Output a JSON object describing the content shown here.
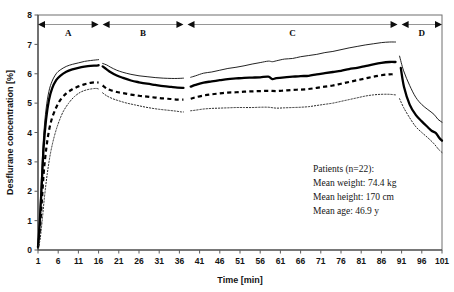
{
  "chart_data": {
    "type": "line",
    "title": "",
    "xlabel": "Time [min]",
    "ylabel": "Desflurane concentration [%]",
    "xlim": [
      1,
      101
    ],
    "ylim": [
      0,
      8
    ],
    "xticks": [
      1,
      6,
      11,
      16,
      21,
      26,
      31,
      36,
      41,
      46,
      51,
      56,
      61,
      66,
      71,
      76,
      81,
      86,
      91,
      96,
      101
    ],
    "yticks": [
      0,
      1,
      2,
      3,
      4,
      5,
      6,
      7,
      8
    ],
    "grid": false,
    "legend_position": "none",
    "x_tick_labels": [
      "1",
      "6",
      "11",
      "16",
      "21",
      "26",
      "31",
      "36",
      "41",
      "46",
      "51",
      "56",
      "61",
      "66",
      "71",
      "76",
      "81",
      "86",
      "91",
      "96",
      "101"
    ],
    "y_tick_labels": [
      "0",
      "1",
      "2",
      "3",
      "4",
      "5",
      "6",
      "7",
      "8"
    ],
    "phases": [
      {
        "label": "A",
        "x_start": 1,
        "x_end": 16
      },
      {
        "label": "B",
        "x_start": 17,
        "x_end": 37
      },
      {
        "label": "C",
        "x_start": 38,
        "x_end": 90
      },
      {
        "label": "D",
        "x_start": 91,
        "x_end": 101
      }
    ],
    "annotations": [
      "Patients (n=22):",
      "Mean weight:  74.4 kg",
      "Mean height:  170 cm",
      "Mean age: 46.9 y"
    ],
    "series": [
      {
        "name": "upper-percentile",
        "style": "thin-solid",
        "segments": [
          {
            "x": [
              1,
              1.4,
              1.9,
              2.4,
              3,
              3.7,
              4.5,
              5.5,
              6.5,
              8,
              9.5,
              11,
              12.5,
              14,
              15.3,
              16
            ],
            "y": [
              0.15,
              1.1,
              2.6,
              3.9,
              4.8,
              5.4,
              5.75,
              6.0,
              6.13,
              6.25,
              6.32,
              6.37,
              6.42,
              6.45,
              6.47,
              6.48
            ]
          },
          {
            "x": [
              17,
              18,
              19,
              20.5,
              22,
              24,
              26,
              28,
              30,
              32,
              34,
              35.5,
              37
            ],
            "y": [
              6.35,
              6.3,
              6.22,
              6.12,
              6.05,
              5.98,
              5.93,
              5.9,
              5.87,
              5.85,
              5.84,
              5.84,
              5.85
            ]
          },
          {
            "x": [
              38.8,
              40,
              42,
              44,
              46,
              48,
              50,
              52,
              54,
              56,
              58,
              59,
              60,
              62,
              64,
              66,
              68,
              70,
              72,
              74,
              76,
              78,
              80,
              82,
              84,
              86,
              88,
              89.5
            ],
            "y": [
              5.88,
              5.93,
              6.02,
              6.06,
              6.12,
              6.18,
              6.22,
              6.27,
              6.33,
              6.38,
              6.43,
              6.41,
              6.44,
              6.5,
              6.52,
              6.58,
              6.62,
              6.66,
              6.72,
              6.76,
              6.82,
              6.88,
              6.93,
              6.98,
              7.02,
              7.06,
              7.08,
              7.08
            ]
          },
          {
            "x": [
              90.5,
              91.5,
              93,
              94.5,
              96,
              97.5,
              99,
              100,
              101
            ],
            "y": [
              6.6,
              6.1,
              5.6,
              5.2,
              4.95,
              4.78,
              4.62,
              4.45,
              4.35
            ]
          }
        ]
      },
      {
        "name": "mean",
        "style": "thick-solid",
        "segments": [
          {
            "x": [
              1,
              1.4,
              1.9,
              2.4,
              3,
              3.7,
              4.5,
              5.5,
              6.5,
              8,
              9.5,
              11,
              12.5,
              14,
              15.3,
              16
            ],
            "y": [
              0.1,
              0.85,
              2.15,
              3.5,
              4.45,
              5.1,
              5.5,
              5.78,
              5.93,
              6.07,
              6.15,
              6.2,
              6.24,
              6.27,
              6.28,
              6.29
            ]
          },
          {
            "x": [
              17,
              18,
              19,
              20.5,
              22,
              24,
              26,
              28,
              30,
              32,
              34,
              35.5,
              37
            ],
            "y": [
              6.25,
              6.15,
              6.05,
              5.94,
              5.86,
              5.77,
              5.71,
              5.66,
              5.62,
              5.58,
              5.55,
              5.53,
              5.52
            ]
          },
          {
            "x": [
              38.8,
              40,
              42,
              44,
              46,
              48,
              50,
              52,
              54,
              56,
              58,
              59,
              60,
              62,
              64,
              66,
              68,
              70,
              72,
              74,
              76,
              78,
              80,
              82,
              84,
              86,
              88,
              89.5
            ],
            "y": [
              5.56,
              5.62,
              5.7,
              5.74,
              5.78,
              5.82,
              5.84,
              5.86,
              5.87,
              5.88,
              5.9,
              5.82,
              5.85,
              5.88,
              5.9,
              5.92,
              5.93,
              5.98,
              6.02,
              6.06,
              6.1,
              6.16,
              6.2,
              6.26,
              6.32,
              6.37,
              6.4,
              6.4
            ]
          },
          {
            "x": [
              90.8,
              91.6,
              93,
              94.5,
              96,
              97.5,
              98.5,
              99.5,
              100.3,
              101
            ],
            "y": [
              6.2,
              5.55,
              4.95,
              4.6,
              4.38,
              4.18,
              4.05,
              3.98,
              3.82,
              3.72
            ]
          }
        ]
      },
      {
        "name": "lower-percentile-dashed",
        "style": "thick-dashed",
        "segments": [
          {
            "x": [
              1,
              1.4,
              1.9,
              2.4,
              3,
              3.7,
              4.5,
              5.5,
              6.5,
              8,
              9.5,
              11,
              12.5,
              14,
              15.3,
              16
            ],
            "y": [
              0.08,
              0.6,
              1.55,
              2.6,
              3.4,
              4.05,
              4.5,
              4.85,
              5.1,
              5.33,
              5.47,
              5.57,
              5.64,
              5.69,
              5.71,
              5.7
            ]
          },
          {
            "x": [
              17,
              18,
              19,
              20.5,
              22,
              24,
              26,
              28,
              30,
              32,
              34,
              35.5,
              37
            ],
            "y": [
              5.6,
              5.5,
              5.44,
              5.38,
              5.34,
              5.29,
              5.25,
              5.22,
              5.19,
              5.16,
              5.14,
              5.12,
              5.12
            ]
          },
          {
            "x": [
              38.8,
              40,
              42,
              44,
              46,
              48,
              50,
              52,
              54,
              56,
              58,
              60,
              62,
              64,
              66,
              68,
              70,
              72,
              74,
              76,
              78,
              80,
              82,
              84,
              86,
              88,
              89.5
            ],
            "y": [
              5.15,
              5.2,
              5.26,
              5.3,
              5.33,
              5.36,
              5.37,
              5.39,
              5.4,
              5.41,
              5.42,
              5.41,
              5.43,
              5.45,
              5.46,
              5.48,
              5.52,
              5.56,
              5.6,
              5.66,
              5.72,
              5.78,
              5.84,
              5.9,
              5.95,
              5.98,
              5.98
            ]
          }
        ]
      },
      {
        "name": "lowest-percentile-dotted",
        "style": "thin-dotted",
        "segments": [
          {
            "x": [
              1,
              1.5,
              2,
              2.6,
              3.3,
              4.1,
              5,
              6,
              7.2,
              8.6,
              10,
              11.5,
              13,
              14.5,
              15.5,
              16
            ],
            "y": [
              0.05,
              0.35,
              0.95,
              1.8,
              2.6,
              3.3,
              3.85,
              4.3,
              4.7,
              5.0,
              5.22,
              5.37,
              5.45,
              5.49,
              5.5,
              5.48
            ]
          },
          {
            "x": [
              17,
              18,
              19.5,
              21,
              23,
              25,
              27,
              29,
              31,
              33,
              35,
              36.5,
              37
            ],
            "y": [
              5.35,
              5.25,
              5.15,
              5.08,
              5.0,
              4.94,
              4.88,
              4.83,
              4.79,
              4.76,
              4.73,
              4.7,
              4.7
            ]
          },
          {
            "x": [
              38.8,
              40,
              42,
              44,
              46,
              48,
              50,
              52,
              54,
              56,
              58,
              60,
              62,
              64,
              66,
              68,
              70,
              72,
              74,
              76,
              78,
              80,
              82,
              84,
              86,
              88,
              89.5
            ],
            "y": [
              4.74,
              4.76,
              4.8,
              4.82,
              4.83,
              4.84,
              4.85,
              4.85,
              4.85,
              4.86,
              4.86,
              4.83,
              4.84,
              4.85,
              4.86,
              4.88,
              4.92,
              4.96,
              5.0,
              5.06,
              5.12,
              5.18,
              5.24,
              5.28,
              5.3,
              5.3,
              5.28
            ]
          },
          {
            "x": [
              90.5,
              91.5,
              93,
              94.5,
              96,
              97.5,
              99,
              100.2,
              101
            ],
            "y": [
              5.15,
              4.85,
              4.5,
              4.2,
              4.0,
              3.82,
              3.62,
              3.42,
              3.32
            ]
          }
        ]
      }
    ]
  },
  "plot_geometry": {
    "left": 38,
    "right": 442,
    "top": 15,
    "bottom": 250
  }
}
